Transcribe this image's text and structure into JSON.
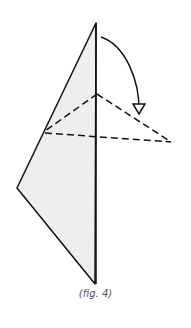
{
  "figure": {
    "caption": "(fig. 4)",
    "colors": {
      "fill": "#eeeeee",
      "stroke": "#111111",
      "caption": "#555555"
    },
    "shapes": {
      "shaded_polygon": "96,23 17,188 95,284",
      "center_line": "96,23 96,284",
      "dashed_lines": [
        "97,94 45,131",
        "45,133 171,142",
        "97,94 171,142"
      ],
      "arrow_path": "M101,37 C125,45 140,80 139,113",
      "arrow_head": "133,104 145,104 139,114"
    }
  }
}
